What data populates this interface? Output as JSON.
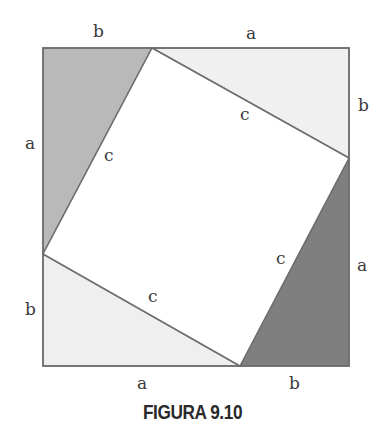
{
  "figure": {
    "caption": "FIGURA 9.10",
    "outer_square": {
      "x1": 43,
      "y1": 48,
      "x2": 349,
      "y2": 366
    },
    "inner_square_vertices": {
      "top": [
        152,
        48
      ],
      "right": [
        349,
        158
      ],
      "bottom": [
        240,
        366
      ],
      "left": [
        43,
        254
      ]
    },
    "colors": {
      "outline": "#6e6e6e",
      "tri_top_left": "#b9b9b9",
      "tri_top_right": "#f0f0f0",
      "tri_bottom_left": "#efefef",
      "tri_bottom_right": "#7f7f7f",
      "inner_square": "#ffffff"
    },
    "labels": {
      "top_left_segment": "b",
      "top_right_segment": "a",
      "left_upper_segment": "a",
      "left_lower_segment": "b",
      "right_upper_segment": "b",
      "right_lower_segment": "a",
      "bottom_left_segment": "a",
      "bottom_right_segment": "b",
      "hyp_top_left": "c",
      "hyp_top_right": "c",
      "hyp_bottom_left": "c",
      "hyp_bottom_right": "c"
    }
  }
}
